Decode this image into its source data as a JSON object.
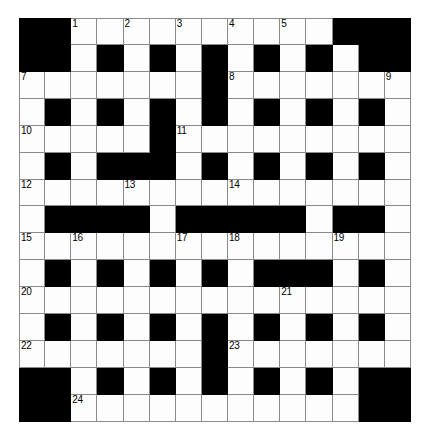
{
  "puzzle": {
    "title": "Crossword Grid",
    "rows": 15,
    "columns": 15,
    "cell_size_px": 26,
    "colors": {
      "block": "#000000",
      "cell": "#fdfdfd",
      "grid_line": "#8a8a8a",
      "number_text": "#000000",
      "page_background": "#ffffff"
    },
    "legend": {
      "block_symbol": "#",
      "open_symbol": "."
    },
    "grid": [
      "##..........###",
      "##.#.#.#.#.#.##",
      ".......#.......",
      ".#.#.#.#.#.#.#.",
      ".....#.........",
      ".#.###.#.#.#.#.",
      "......._.......",
      ".####.#####.##.",
      "...............",
      ".#.#.#.#.###.#.",
      "...............",
      ".#.#.#.#.#.#.#.",
      ".......#.......",
      "##.#.#.#.#.#.##",
      "##...........##"
    ],
    "numbers": [
      {
        "clue": 1,
        "row": 0,
        "col": 2
      },
      {
        "clue": 2,
        "row": 0,
        "col": 4
      },
      {
        "clue": 3,
        "row": 0,
        "col": 6
      },
      {
        "clue": 4,
        "row": 0,
        "col": 8
      },
      {
        "clue": 5,
        "row": 0,
        "col": 10
      },
      {
        "clue": 6,
        "row": 0,
        "col": 12
      },
      {
        "clue": 7,
        "row": 2,
        "col": 0
      },
      {
        "clue": 8,
        "row": 2,
        "col": 8
      },
      {
        "clue": 9,
        "row": 2,
        "col": 14
      },
      {
        "clue": 10,
        "row": 4,
        "col": 0
      },
      {
        "clue": 11,
        "row": 4,
        "col": 6
      },
      {
        "clue": 12,
        "row": 6,
        "col": 0
      },
      {
        "clue": 13,
        "row": 6,
        "col": 4
      },
      {
        "clue": 14,
        "row": 6,
        "col": 8
      },
      {
        "clue": 15,
        "row": 8,
        "col": 0
      },
      {
        "clue": 16,
        "row": 8,
        "col": 2
      },
      {
        "clue": 17,
        "row": 8,
        "col": 6
      },
      {
        "clue": 18,
        "row": 8,
        "col": 8
      },
      {
        "clue": 19,
        "row": 8,
        "col": 12
      },
      {
        "clue": 20,
        "row": 10,
        "col": 0
      },
      {
        "clue": 21,
        "row": 10,
        "col": 10
      },
      {
        "clue": 22,
        "row": 12,
        "col": 0
      },
      {
        "clue": 23,
        "row": 12,
        "col": 8
      },
      {
        "clue": 24,
        "row": 14,
        "col": 2
      }
    ]
  }
}
